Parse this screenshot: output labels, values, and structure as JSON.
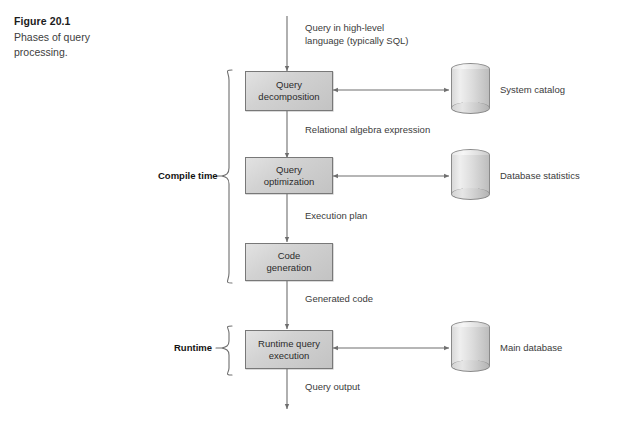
{
  "figure": {
    "number": "Figure 20.1",
    "caption": "Phases of query\nprocessing."
  },
  "flow": {
    "input_label": "Query in high-level\nlanguage (typically SQL)",
    "stages": [
      {
        "id": "query-decomposition",
        "label": "Query\ndecomposition"
      },
      {
        "id": "query-optimization",
        "label": "Query\noptimization"
      },
      {
        "id": "code-generation",
        "label": "Code\ngeneration"
      },
      {
        "id": "runtime-query-execution",
        "label": "Runtime query\nexecution"
      }
    ],
    "between_labels": [
      {
        "id": "relational-algebra-expression",
        "label": "Relational algebra expression"
      },
      {
        "id": "execution-plan",
        "label": "Execution plan"
      },
      {
        "id": "generated-code",
        "label": "Generated code"
      },
      {
        "id": "query-output",
        "label": "Query output"
      }
    ],
    "datastores": [
      {
        "id": "system-catalog",
        "label": "System catalog"
      },
      {
        "id": "database-statistics",
        "label": "Database statistics"
      },
      {
        "id": "main-database",
        "label": "Main database"
      }
    ],
    "phases": [
      {
        "id": "compile-time",
        "label": "Compile time"
      },
      {
        "id": "runtime",
        "label": "Runtime"
      }
    ]
  },
  "colors": {
    "box_fill": "#d2d2d2",
    "box_stroke": "#787878",
    "line": "#6e6e6e",
    "text": "#3b3b3b",
    "heading": "#131313",
    "background": "#ffffff"
  }
}
